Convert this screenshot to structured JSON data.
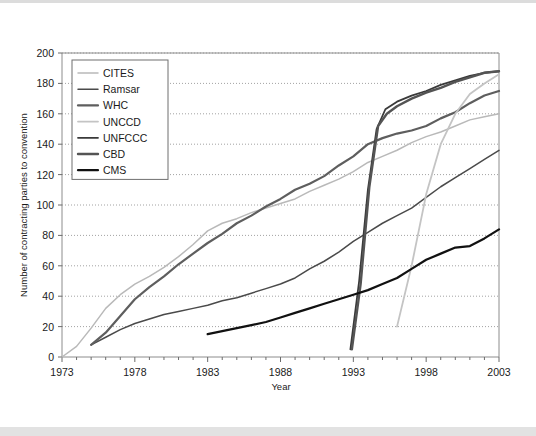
{
  "chart_data": {
    "type": "line",
    "title": "",
    "xlabel": "Year",
    "ylabel": "Number of contracting parties to convention",
    "xlim": [
      1973,
      2003
    ],
    "ylim": [
      0,
      200
    ],
    "xticks": [
      1973,
      1978,
      1983,
      1988,
      1993,
      1998,
      2003
    ],
    "xtick_labels": [
      "1973",
      "1978",
      "1983",
      "1988",
      "1993",
      "1998",
      "2003"
    ],
    "xminor_step": 1,
    "yticks": [
      0,
      20,
      40,
      60,
      80,
      100,
      120,
      140,
      160,
      180,
      200
    ],
    "ytick_labels": [
      "0",
      "20",
      "40",
      "60",
      "80",
      "100",
      "120",
      "140",
      "160",
      "180",
      "200"
    ],
    "grid": "horizontal-dotted",
    "legend_position": "top-left",
    "series": [
      {
        "name": "CITES",
        "color": "#b9b9b9",
        "width": 1.5,
        "points": [
          [
            1973,
            0
          ],
          [
            1974,
            7
          ],
          [
            1975,
            19
          ],
          [
            1976,
            32
          ],
          [
            1977,
            41
          ],
          [
            1978,
            48
          ],
          [
            1979,
            53
          ],
          [
            1980,
            59
          ],
          [
            1981,
            66
          ],
          [
            1982,
            74
          ],
          [
            1983,
            83
          ],
          [
            1984,
            88
          ],
          [
            1985,
            91
          ],
          [
            1986,
            95
          ],
          [
            1987,
            98
          ],
          [
            1988,
            101
          ],
          [
            1989,
            104
          ],
          [
            1990,
            109
          ],
          [
            1991,
            113
          ],
          [
            1992,
            117
          ],
          [
            1993,
            122
          ],
          [
            1994,
            128
          ],
          [
            1995,
            132
          ],
          [
            1996,
            136
          ],
          [
            1997,
            141
          ],
          [
            1998,
            145
          ],
          [
            1999,
            148
          ],
          [
            2000,
            152
          ],
          [
            2001,
            156
          ],
          [
            2002,
            158
          ],
          [
            2003,
            160
          ]
        ]
      },
      {
        "name": "Ramsar",
        "color": "#4a4a4a",
        "width": 1.5,
        "points": [
          [
            1975,
            8
          ],
          [
            1976,
            13
          ],
          [
            1977,
            18
          ],
          [
            1978,
            22
          ],
          [
            1979,
            25
          ],
          [
            1980,
            28
          ],
          [
            1981,
            30
          ],
          [
            1982,
            32
          ],
          [
            1983,
            34
          ],
          [
            1984,
            37
          ],
          [
            1985,
            39
          ],
          [
            1986,
            42
          ],
          [
            1987,
            45
          ],
          [
            1988,
            48
          ],
          [
            1989,
            52
          ],
          [
            1990,
            58
          ],
          [
            1991,
            63
          ],
          [
            1992,
            69
          ],
          [
            1993,
            76
          ],
          [
            1994,
            82
          ],
          [
            1995,
            88
          ],
          [
            1996,
            93
          ],
          [
            1997,
            98
          ],
          [
            1998,
            105
          ],
          [
            1999,
            112
          ],
          [
            2000,
            118
          ],
          [
            2001,
            124
          ],
          [
            2002,
            130
          ],
          [
            2003,
            136
          ]
        ]
      },
      {
        "name": "WHC",
        "color": "#5e5e5e",
        "width": 2.2,
        "points": [
          [
            1975,
            8
          ],
          [
            1976,
            16
          ],
          [
            1977,
            27
          ],
          [
            1978,
            38
          ],
          [
            1979,
            46
          ],
          [
            1980,
            53
          ],
          [
            1981,
            61
          ],
          [
            1982,
            68
          ],
          [
            1983,
            75
          ],
          [
            1984,
            81
          ],
          [
            1985,
            88
          ],
          [
            1986,
            93
          ],
          [
            1987,
            99
          ],
          [
            1988,
            104
          ],
          [
            1989,
            110
          ],
          [
            1990,
            114
          ],
          [
            1991,
            119
          ],
          [
            1992,
            126
          ],
          [
            1993,
            132
          ],
          [
            1994,
            140
          ],
          [
            1995,
            144
          ],
          [
            1996,
            147
          ],
          [
            1997,
            149
          ],
          [
            1998,
            152
          ],
          [
            1999,
            157
          ],
          [
            2000,
            161
          ],
          [
            2001,
            167
          ],
          [
            2002,
            172
          ],
          [
            2003,
            175
          ]
        ]
      },
      {
        "name": "UNCCD",
        "color": "#c4c4c4",
        "width": 1.8,
        "points": [
          [
            1996,
            20
          ],
          [
            1997,
            60
          ],
          [
            1998,
            107
          ],
          [
            1999,
            140
          ],
          [
            2000,
            160
          ],
          [
            2001,
            173
          ],
          [
            2002,
            180
          ],
          [
            2003,
            186
          ]
        ]
      },
      {
        "name": "UNFCCC",
        "color": "#3a3a3a",
        "width": 1.8,
        "points": [
          [
            1992.8,
            5
          ],
          [
            1993.4,
            50
          ],
          [
            1994.0,
            110
          ],
          [
            1994.6,
            150
          ],
          [
            1995.2,
            163
          ],
          [
            1996,
            168
          ],
          [
            1997,
            172
          ],
          [
            1998,
            175
          ],
          [
            1999,
            179
          ],
          [
            2000,
            182
          ],
          [
            2001,
            185
          ],
          [
            2002,
            187
          ],
          [
            2003,
            188
          ]
        ]
      },
      {
        "name": "CBD",
        "color": "#545454",
        "width": 2.4,
        "points": [
          [
            1992.9,
            5
          ],
          [
            1993.5,
            48
          ],
          [
            1994.1,
            112
          ],
          [
            1994.7,
            152
          ],
          [
            1995.3,
            160
          ],
          [
            1996,
            165
          ],
          [
            1997,
            170
          ],
          [
            1998,
            174
          ],
          [
            1999,
            177
          ],
          [
            2000,
            181
          ],
          [
            2001,
            184
          ],
          [
            2002,
            187
          ],
          [
            2003,
            188
          ]
        ]
      },
      {
        "name": "CMS",
        "color": "#111111",
        "width": 2.2,
        "points": [
          [
            1983,
            15
          ],
          [
            1984,
            17
          ],
          [
            1985,
            19
          ],
          [
            1986,
            21
          ],
          [
            1987,
            23
          ],
          [
            1988,
            26
          ],
          [
            1989,
            29
          ],
          [
            1990,
            32
          ],
          [
            1991,
            35
          ],
          [
            1992,
            38
          ],
          [
            1993,
            41
          ],
          [
            1994,
            44
          ],
          [
            1995,
            48
          ],
          [
            1996,
            52
          ],
          [
            1997,
            58
          ],
          [
            1998,
            64
          ],
          [
            1999,
            68
          ],
          [
            2000,
            72
          ],
          [
            2001,
            73
          ],
          [
            2002,
            78
          ],
          [
            2003,
            84
          ]
        ]
      }
    ]
  },
  "legend": {
    "items": [
      {
        "label": "CITES"
      },
      {
        "label": "Ramsar"
      },
      {
        "label": "WHC"
      },
      {
        "label": "UNCCD"
      },
      {
        "label": "UNFCCC"
      },
      {
        "label": "CBD"
      },
      {
        "label": "CMS"
      }
    ]
  }
}
